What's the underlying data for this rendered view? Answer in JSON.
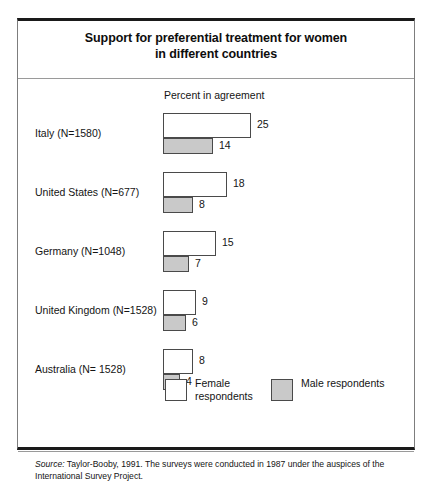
{
  "figure": {
    "title_line_1": "Support for preferential treatment for women",
    "title_line_2": "in different countries",
    "axis_caption": "Percent in agreement",
    "source_label": "Source:",
    "source_text": " Taylor-Booby, 1991. The surveys were conducted in 1987 under the auspices of the International Survey Project."
  },
  "legend": {
    "female_label": "Female respondents",
    "male_label": "Male respondents",
    "female_color": "#ffffff",
    "male_color": "#c9c9c9",
    "border_color": "#4a4a4a"
  },
  "chart_data": {
    "type": "bar",
    "title": "Support for preferential treatment for women in different countries",
    "xlabel": "Percent in agreement",
    "ylabel": "",
    "orientation": "horizontal",
    "grid": false,
    "legend_position": "bottom",
    "xlim": [
      0,
      25
    ],
    "categories": [
      "Italy (N=1580)",
      "United States (N=677)",
      "Germany (N=1048)",
      "United Kingdom (N=1528)",
      "Australia (N= 1528)"
    ],
    "series": [
      {
        "name": "Female respondents",
        "values": [
          25,
          18,
          15,
          9,
          8
        ]
      },
      {
        "name": "Male respondents",
        "values": [
          14,
          8,
          7,
          6,
          4
        ]
      }
    ]
  },
  "rows": [
    {
      "label": "Italy (N=1580)",
      "female_value": "25",
      "male_value": "14",
      "female_px": 88,
      "male_px": 50
    },
    {
      "label": "United States (N=677)",
      "female_value": "18",
      "male_value": "8",
      "female_px": 64,
      "male_px": 30
    },
    {
      "label": "Germany (N=1048)",
      "female_value": "15",
      "male_value": "7",
      "female_px": 53,
      "male_px": 26
    },
    {
      "label": "United Kingdom (N=1528)",
      "female_value": "9",
      "male_value": "6",
      "female_px": 33,
      "male_px": 23
    },
    {
      "label": "Australia (N= 1528)",
      "female_value": "8",
      "male_value": "4",
      "female_px": 30,
      "male_px": 17
    }
  ]
}
